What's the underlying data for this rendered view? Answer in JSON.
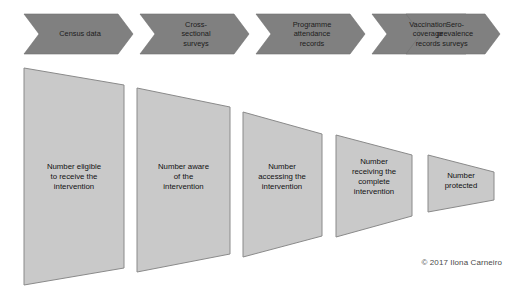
{
  "diagram": {
    "background_color": "#ffffff",
    "chevron_fill": "#808080",
    "chevron_text_color": "#1c1c1c",
    "funnel_fill": "#c9c9c9",
    "funnel_stroke": "#8a8a8a",
    "funnel_text_color": "#111111"
  },
  "data_sources": {
    "items": [
      {
        "label": "Census data"
      },
      {
        "label": "Cross-\nsectional\nsurveys"
      },
      {
        "label": "Programme\nattendance\nrecords"
      },
      {
        "label": "Vaccination\ncoverage\nrecords"
      },
      {
        "label": "Sero-\nprevalence\nsurveys"
      }
    ]
  },
  "cascade": {
    "stages": [
      {
        "label": "Number eligible\nto receive the\nintervention"
      },
      {
        "label": "Number aware\nof the\nintervention"
      },
      {
        "label": "Number\naccessing the\nintervention"
      },
      {
        "label": "Number\nreceiving the\ncomplete\nintervention"
      },
      {
        "label": "Number\nprotected"
      }
    ]
  },
  "footer": {
    "copyright": "© 2017 Ilona Carneiro"
  }
}
